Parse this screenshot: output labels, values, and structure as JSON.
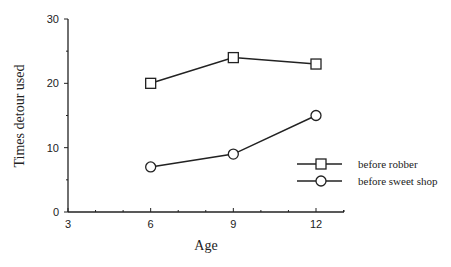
{
  "chart_data": {
    "type": "line",
    "title": "",
    "xlabel": "Age",
    "ylabel": "Times detour used",
    "x": [
      6,
      9,
      12
    ],
    "xlim": [
      3,
      13
    ],
    "ylim": [
      0,
      30
    ],
    "x_ticks": [
      "3",
      "6",
      "9",
      "12"
    ],
    "y_ticks": [
      "0",
      "10",
      "20",
      "30"
    ],
    "grid": false,
    "legend_position": "right, lower-middle inside plot",
    "series": [
      {
        "name": "before robber",
        "marker": "square",
        "values": [
          20,
          24,
          23
        ]
      },
      {
        "name": "before sweet shop",
        "marker": "circle",
        "values": [
          7,
          9,
          15
        ]
      }
    ]
  }
}
